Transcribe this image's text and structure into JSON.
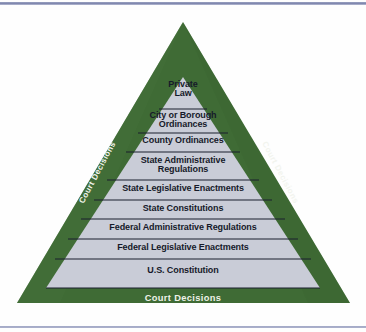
{
  "diagram": {
    "type": "pyramid",
    "colors": {
      "outer_green": "#3f6b35",
      "inner_gray": "#c9ccd7",
      "divider": "#1c2030",
      "row_text": "#161a2a",
      "green_text": "#f1f4ea",
      "rule_blue": "#8f96ba",
      "page_background": "#fefefe"
    },
    "levels": [
      {
        "index": 1,
        "label": "Private\nLaw",
        "lines": [
          "Private",
          "Law"
        ]
      },
      {
        "index": 2,
        "label": "City or Borough\nOrdinances",
        "lines": [
          "City or Borough",
          "Ordinances"
        ]
      },
      {
        "index": 3,
        "label": "County Ordinances",
        "lines": [
          "County Ordinances"
        ]
      },
      {
        "index": 4,
        "label": "State Administrative\nRegulations",
        "lines": [
          "State Administrative",
          "Regulations"
        ]
      },
      {
        "index": 5,
        "label": "State Legislative Enactments",
        "lines": [
          "State Legislative Enactments"
        ]
      },
      {
        "index": 6,
        "label": "State Constitutions",
        "lines": [
          "State Constitutions"
        ]
      },
      {
        "index": 7,
        "label": "Federal Administrative Regulations",
        "lines": [
          "Federal Administrative Regulations"
        ]
      },
      {
        "index": 8,
        "label": "Federal Legislative Enactments",
        "lines": [
          "Federal Legislative Enactments"
        ]
      },
      {
        "index": 9,
        "label": "U.S. Constitution",
        "lines": [
          "U.S. Constitution"
        ]
      }
    ],
    "border_labels": {
      "left": "Court Decisions",
      "right": "Court Decisions",
      "bottom": "Court Decisions"
    }
  }
}
